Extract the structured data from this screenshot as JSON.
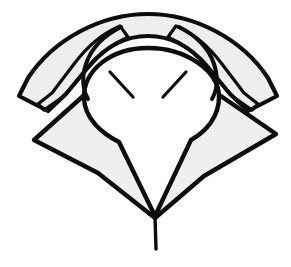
{
  "document": {
    "title": "Collar",
    "kind": "line-art-illustration",
    "subject": "shirt collar",
    "view": "front",
    "width": 291,
    "height": 267
  },
  "colors": {
    "background": "#ffffff",
    "outline": "#0d0d0d",
    "fabric_fill": "#eeeeee",
    "fabric_front_fill": "#efefef",
    "opening_fill": "#ffffff"
  },
  "strokes": {
    "outline_width": 4.2,
    "front_outline_width": 4.4,
    "band_width": 4.0,
    "placket_width": 3.4
  },
  "shapes": {
    "back_collar_outer": {
      "name": "back-collar-outer",
      "path": "M 148 14 C 196 14 243 40 268 78 L 277 96 L 248 111 L 230 94 L 207 66 C 190 46 170 36 148 36 C 126 36 106 46 89 66 L 66 94 L 48 111 L 19 96 L 28 78 C 53 40 100 14 148 14 Z"
    },
    "back_collar_inner_left": {
      "name": "back-collar-inner-left",
      "path": "M 120 26 C 101 34 86 48 74 64 L 52 93 L 38 104 L 44 110 L 64 96 L 88 68 C 99 55 112 44 128 37 Z"
    },
    "back_collar_inner_right": {
      "name": "back-collar-inner-right",
      "path": "M 176 26 C 195 34 210 48 222 64 L 244 93 L 258 104 L 252 110 L 232 96 L 208 68 C 197 55 184 44 168 37 Z"
    },
    "left_lapel": {
      "name": "left-lapel",
      "path": "M 110 72 L 133 97 L 155 218 L 98 173 L 34 140 Z"
    },
    "right_lapel": {
      "name": "right-lapel",
      "path": "M 186 72 L 163 97 L 155 218 L 204 176 L 276 134 Z"
    },
    "neck_opening": {
      "name": "neck-opening",
      "path": "M 148 48 C 111 48 84 70 84 97 C 84 119 103 134 119 142 L 155 216 L 191 140 C 207 131 219 116 219 97 C 219 70 185 48 148 48 Z"
    },
    "band_arc_left": {
      "name": "collar-band-arc-left",
      "path": "M 121 27 C 103 36 91 49 86 64 C 82 76 82 88 88 99"
    },
    "band_arc_right": {
      "name": "collar-band-arc-right",
      "path": "M 179 27 C 197 36 209 49 214 64 C 218 76 218 88 212 99"
    },
    "placket": {
      "name": "center-front-placket",
      "path": "M 155 216 L 156 249"
    },
    "left_fold": {
      "name": "left-fold-crease",
      "path": "M 110 72 L 133 97"
    },
    "right_fold": {
      "name": "right-fold-crease",
      "path": "M 186 72 L 163 97"
    }
  },
  "labels": {
    "back_collar": "back collar",
    "left_lapel": "left lapel",
    "right_lapel": "right lapel",
    "neck_opening": "neck opening",
    "placket": "center front placket"
  }
}
